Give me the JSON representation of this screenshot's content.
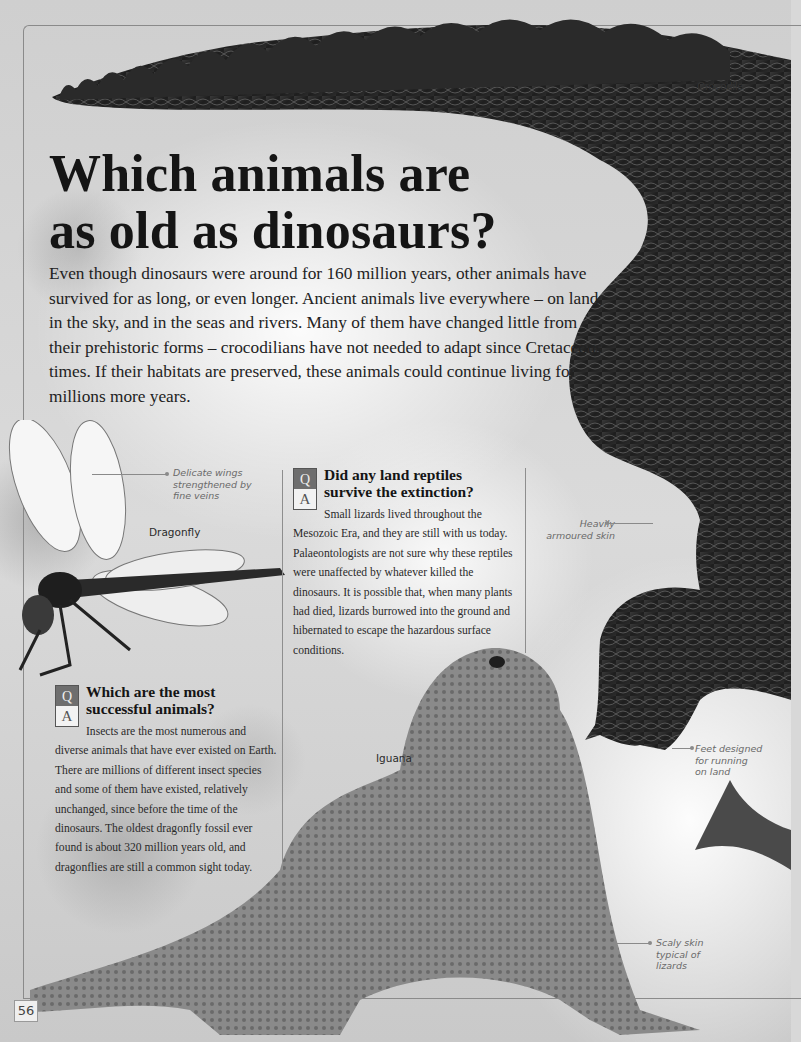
{
  "page": {
    "title": "Which animals are as old as dinosaurs?",
    "title_lines": [
      "Which animals are",
      "as old as dinosaurs?"
    ],
    "intro": "Even though dinosaurs were around for 160 million years, other animals have survived for as long, or even longer. Ancient animals live everywhere – on land, in the sky, and in the seas and rivers. Many of them have changed little from their prehistoric forms – crocodilians have not needed to adapt since Cretaceous times. If their habitats are preserved, these animals could continue living for millions more years.",
    "page_number": "56"
  },
  "animal_labels": {
    "crocodile": "Crocodile",
    "dragonfly": "Dragonfly",
    "iguana": "Iguana"
  },
  "annotations": {
    "wings": [
      "Delicate wings",
      "strengthened by",
      "fine veins"
    ],
    "skin": [
      "Heavily",
      "armoured skin"
    ],
    "feet": [
      "Feet designed",
      "for running",
      "on land"
    ],
    "scaly": [
      "Scaly skin",
      "typical of",
      "lizards"
    ]
  },
  "qa": [
    {
      "q_letter": "Q",
      "a_letter": "A",
      "question_lines": [
        "Did any land reptiles",
        "survive the extinction?"
      ],
      "answer": "Small lizards lived throughout the Mesozoic Era, and they are still with us today. Palaeontologists are not sure why these reptiles were unaffected by whatever killed the dinosaurs. It is possible that, when many plants had died, lizards burrowed into the ground and hibernated to escape the hazardous surface conditions."
    },
    {
      "q_letter": "Q",
      "a_letter": "A",
      "question_lines": [
        "Which are the most",
        "successful animals?"
      ],
      "answer": "Insects are the most numerous and diverse animals that have ever existed on Earth. There are millions of different insect species and some of them have existed, relatively unchanged, since before the time of the dinosaurs. The oldest dragonfly fossil ever found is about 320 million years old, and dragonflies are still a common sight today."
    }
  ]
}
